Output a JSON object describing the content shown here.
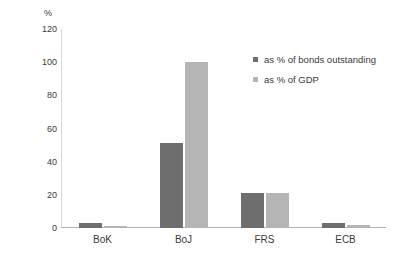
{
  "chart_data": {
    "type": "bar",
    "title": "",
    "subtitle": "",
    "xlabel": "",
    "ylabel": "%",
    "ylim": [
      0,
      120
    ],
    "yticks": [
      0,
      20,
      40,
      60,
      80,
      100,
      120
    ],
    "grid": false,
    "legend_position": "top-right-inside",
    "categories": [
      "BoK",
      "BoJ",
      "FRS",
      "ECB"
    ],
    "series": [
      {
        "name": "as % of bonds outstanding",
        "color": "#6e6e6e",
        "values": [
          3,
          51,
          21,
          3
        ]
      },
      {
        "name": "as % of GDP",
        "color": "#b5b5b5",
        "values": [
          1,
          100,
          21,
          2
        ]
      }
    ]
  },
  "axis": {
    "y_unit_label": "%",
    "tick_labels": [
      "120",
      "100",
      "80",
      "60",
      "40",
      "20",
      "0"
    ]
  },
  "legend": {
    "items": [
      {
        "label": "as % of bonds outstanding",
        "color": "#6e6e6e"
      },
      {
        "label": "as % of GDP",
        "color": "#b5b5b5"
      }
    ]
  }
}
